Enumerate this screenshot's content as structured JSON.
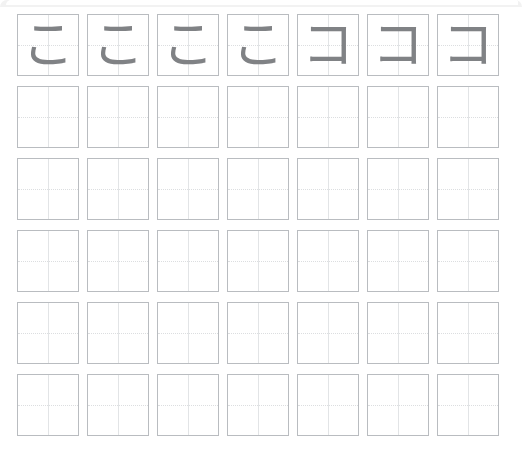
{
  "page": {
    "background_color": "#ffffff",
    "top_band_color": "#f2f2f2"
  },
  "style": {
    "cell_border_color": "#b9bcc0",
    "guide_line_color": "#e2e4e6",
    "guide_dotted_color": "#dcdee0",
    "glyph_color": "#808285"
  },
  "grid": {
    "columns": 7,
    "rows": 6,
    "cell_size_px": 62,
    "column_gap_px": 8,
    "row_gap_px": 10,
    "rows_data": [
      {
        "index": 1,
        "filled": true,
        "cells": [
          {
            "char": "こ",
            "kana": "hiragana-ko",
            "filled": true
          },
          {
            "char": "こ",
            "kana": "hiragana-ko",
            "filled": true
          },
          {
            "char": "こ",
            "kana": "hiragana-ko",
            "filled": true
          },
          {
            "char": "こ",
            "kana": "hiragana-ko",
            "filled": true
          },
          {
            "char": "コ",
            "kana": "katakana-ko",
            "filled": true
          },
          {
            "char": "コ",
            "kana": "katakana-ko",
            "filled": true
          },
          {
            "char": "コ",
            "kana": "katakana-ko",
            "filled": true
          }
        ]
      },
      {
        "index": 2,
        "filled": false,
        "cells": [
          {
            "char": "",
            "kana": "",
            "filled": false
          },
          {
            "char": "",
            "kana": "",
            "filled": false
          },
          {
            "char": "",
            "kana": "",
            "filled": false
          },
          {
            "char": "",
            "kana": "",
            "filled": false
          },
          {
            "char": "",
            "kana": "",
            "filled": false
          },
          {
            "char": "",
            "kana": "",
            "filled": false
          },
          {
            "char": "",
            "kana": "",
            "filled": false
          }
        ]
      },
      {
        "index": 3,
        "filled": false,
        "cells": [
          {
            "char": "",
            "kana": "",
            "filled": false
          },
          {
            "char": "",
            "kana": "",
            "filled": false
          },
          {
            "char": "",
            "kana": "",
            "filled": false
          },
          {
            "char": "",
            "kana": "",
            "filled": false
          },
          {
            "char": "",
            "kana": "",
            "filled": false
          },
          {
            "char": "",
            "kana": "",
            "filled": false
          },
          {
            "char": "",
            "kana": "",
            "filled": false
          }
        ]
      },
      {
        "index": 4,
        "filled": false,
        "cells": [
          {
            "char": "",
            "kana": "",
            "filled": false
          },
          {
            "char": "",
            "kana": "",
            "filled": false
          },
          {
            "char": "",
            "kana": "",
            "filled": false
          },
          {
            "char": "",
            "kana": "",
            "filled": false
          },
          {
            "char": "",
            "kana": "",
            "filled": false
          },
          {
            "char": "",
            "kana": "",
            "filled": false
          },
          {
            "char": "",
            "kana": "",
            "filled": false
          }
        ]
      },
      {
        "index": 5,
        "filled": false,
        "cells": [
          {
            "char": "",
            "kana": "",
            "filled": false
          },
          {
            "char": "",
            "kana": "",
            "filled": false
          },
          {
            "char": "",
            "kana": "",
            "filled": false
          },
          {
            "char": "",
            "kana": "",
            "filled": false
          },
          {
            "char": "",
            "kana": "",
            "filled": false
          },
          {
            "char": "",
            "kana": "",
            "filled": false
          },
          {
            "char": "",
            "kana": "",
            "filled": false
          }
        ]
      },
      {
        "index": 6,
        "filled": false,
        "cells": [
          {
            "char": "",
            "kana": "",
            "filled": false
          },
          {
            "char": "",
            "kana": "",
            "filled": false
          },
          {
            "char": "",
            "kana": "",
            "filled": false
          },
          {
            "char": "",
            "kana": "",
            "filled": false
          },
          {
            "char": "",
            "kana": "",
            "filled": false
          },
          {
            "char": "",
            "kana": "",
            "filled": false
          },
          {
            "char": "",
            "kana": "",
            "filled": false
          }
        ]
      }
    ]
  }
}
